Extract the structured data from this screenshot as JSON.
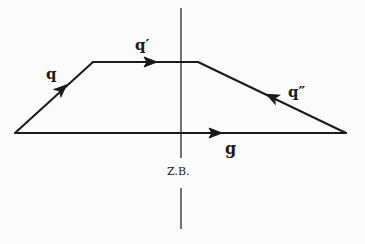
{
  "diagram": {
    "vectors": [
      {
        "id": "q",
        "label": "q",
        "direction": "up-right"
      },
      {
        "id": "q_prime",
        "label": "q′",
        "direction": "right"
      },
      {
        "id": "q_double_prime",
        "label": "q″",
        "direction": "up-left"
      },
      {
        "id": "g",
        "label": "g",
        "direction": "right"
      }
    ],
    "axis_label": "Z.B.",
    "stroke_color": "#1a1a1a",
    "background_color": "#fbfbfb"
  }
}
